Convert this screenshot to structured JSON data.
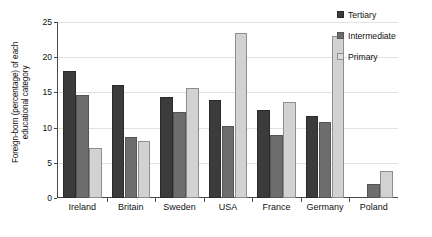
{
  "chart_data": {
    "type": "bar",
    "title": "",
    "xlabel": "",
    "ylabel": "Foreign-born (percentage) of each\neducational category",
    "ylim": [
      0,
      25
    ],
    "yticks": [
      0,
      5,
      10,
      15,
      20,
      25
    ],
    "grid": true,
    "legend_position": "right",
    "categories": [
      "Ireland",
      "Britain",
      "Sweden",
      "USA",
      "France",
      "Germany",
      "Poland"
    ],
    "series": [
      {
        "name": "Tertiary",
        "color": "#3b3b3b",
        "values": [
          18.1,
          16.0,
          14.3,
          13.9,
          12.5,
          11.6,
          0.0
        ]
      },
      {
        "name": "Intermediate",
        "color": "#6d6d6d",
        "values": [
          14.6,
          8.6,
          12.2,
          10.3,
          9.0,
          10.8,
          2.0
        ]
      },
      {
        "name": "Primary",
        "color": "#d2d2d2",
        "values": [
          7.1,
          8.1,
          15.6,
          23.5,
          13.7,
          23.0,
          3.9
        ]
      }
    ]
  },
  "legend": {
    "items": [
      {
        "label": "Tertiary",
        "swatch": "tertiary"
      },
      {
        "label": "Intermediate",
        "swatch": "intermediate"
      },
      {
        "label": "Primary",
        "swatch": "primary"
      }
    ]
  }
}
